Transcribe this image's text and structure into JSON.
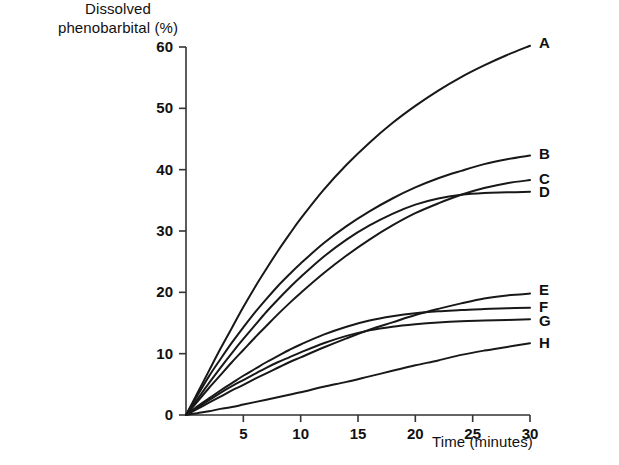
{
  "chart_data": {
    "type": "line",
    "title": "",
    "ylabel_line1": "Dissolved",
    "ylabel_line2": "phenobarbital (%)",
    "xlabel": "Time (minutes)",
    "xlim": [
      0,
      30
    ],
    "ylim": [
      0,
      60
    ],
    "xticks": [
      0,
      5,
      10,
      15,
      20,
      25,
      30
    ],
    "xtick_labels": [
      "0",
      "5",
      "10",
      "15",
      "20",
      "25",
      "30"
    ],
    "yticks": [
      0,
      10,
      20,
      30,
      40,
      50,
      60
    ],
    "ytick_labels": [
      "0",
      "10",
      "20",
      "30",
      "40",
      "50",
      "60"
    ],
    "grid": false,
    "legend_position": "right-of-curve-ends",
    "x": [
      0,
      1,
      2,
      3,
      4,
      5,
      6,
      7,
      8,
      9,
      10,
      12,
      14,
      16,
      18,
      20,
      22,
      24,
      26,
      28,
      30
    ],
    "series": [
      {
        "name": "A",
        "label": "A",
        "end_value": 60.2,
        "values": [
          0,
          3.6,
          7.2,
          10.8,
          14.2,
          17.6,
          20.8,
          23.8,
          26.7,
          29.4,
          32.0,
          36.7,
          40.8,
          44.4,
          47.6,
          50.4,
          52.9,
          55.1,
          57.0,
          58.7,
          60.2
        ]
      },
      {
        "name": "B",
        "label": "B",
        "end_value": 42.3,
        "values": [
          0,
          3.2,
          6.3,
          9.1,
          11.8,
          14.3,
          16.7,
          18.9,
          21.0,
          22.9,
          24.7,
          28.0,
          30.8,
          33.2,
          35.3,
          37.1,
          38.6,
          39.8,
          40.9,
          41.7,
          42.3
        ]
      },
      {
        "name": "C",
        "label": "C",
        "end_value": 38.3,
        "values": [
          0,
          2.2,
          4.4,
          6.5,
          8.6,
          10.6,
          12.6,
          14.5,
          16.4,
          18.2,
          19.9,
          23.1,
          26.0,
          28.6,
          30.9,
          32.9,
          34.5,
          35.9,
          37.0,
          37.8,
          38.3
        ]
      },
      {
        "name": "D",
        "label": "D",
        "end_value": 36.4,
        "values": [
          0,
          2.6,
          5.2,
          7.7,
          10.1,
          12.4,
          14.6,
          16.8,
          18.8,
          20.7,
          22.5,
          25.8,
          28.6,
          30.9,
          32.8,
          34.3,
          35.3,
          35.9,
          36.2,
          36.3,
          36.4
        ]
      },
      {
        "name": "E",
        "label": "E",
        "end_value": 19.8,
        "values": [
          0,
          1.0,
          2.0,
          3.0,
          4.0,
          4.9,
          5.9,
          6.8,
          7.7,
          8.6,
          9.4,
          11.0,
          12.5,
          13.9,
          15.1,
          16.3,
          17.3,
          18.2,
          19.0,
          19.5,
          19.8
        ]
      },
      {
        "name": "F",
        "label": "F",
        "end_value": 17.5,
        "values": [
          0,
          1.4,
          2.7,
          4.0,
          5.2,
          6.4,
          7.5,
          8.6,
          9.6,
          10.6,
          11.5,
          13.1,
          14.4,
          15.4,
          16.1,
          16.6,
          16.9,
          17.1,
          17.3,
          17.4,
          17.5
        ]
      },
      {
        "name": "G",
        "label": "G",
        "end_value": 15.6,
        "values": [
          0,
          1.2,
          2.4,
          3.6,
          4.7,
          5.7,
          6.7,
          7.7,
          8.6,
          9.4,
          10.2,
          11.7,
          12.9,
          13.8,
          14.4,
          14.8,
          15.1,
          15.3,
          15.4,
          15.5,
          15.6
        ]
      },
      {
        "name": "H",
        "label": "H",
        "end_value": 11.7,
        "values": [
          0,
          0.3,
          0.6,
          1.0,
          1.3,
          1.7,
          2.1,
          2.5,
          2.9,
          3.3,
          3.7,
          4.6,
          5.4,
          6.3,
          7.2,
          8.1,
          8.9,
          9.8,
          10.5,
          11.1,
          11.7
        ]
      }
    ]
  }
}
